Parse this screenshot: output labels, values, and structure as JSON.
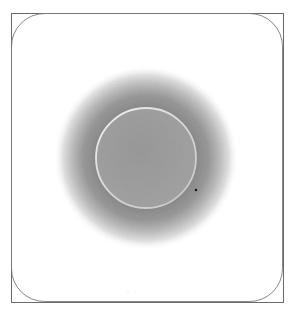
{
  "figure": {
    "description": "Drawing of a circular disk with a diffuse gray halo inside a square frame with rounded inner border",
    "frame": {
      "x": 11,
      "y": 13,
      "width": 272,
      "height": 289,
      "border_color": "#6a6a6a",
      "inner_corner_radius": 33
    },
    "disk": {
      "cx": 146,
      "cy": 158,
      "r": 50,
      "fill_color": "#9c9c9c",
      "rim_color": "#e6e6e6"
    },
    "halo": {
      "cx": 146,
      "cy": 158,
      "r": 92,
      "peak_color": "#8c8c8c",
      "edge_color": "#ffffff"
    },
    "spot": {
      "cx": 196,
      "cy": 190,
      "r": 1.3,
      "color": "#1a1a1a"
    }
  }
}
